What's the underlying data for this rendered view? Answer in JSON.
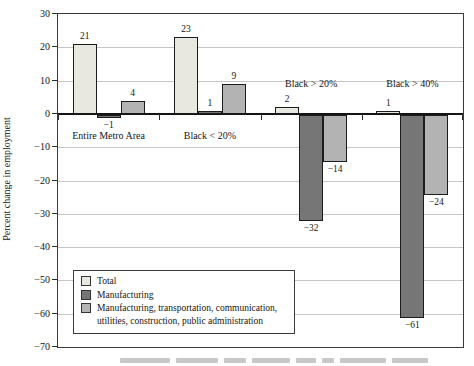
{
  "figure": {
    "y_axis_label": "Percent change in employment"
  },
  "chart_data": {
    "type": "bar",
    "title": "",
    "xlabel": "",
    "ylabel": "Percent change in employment",
    "ylim": [
      -70,
      30
    ],
    "yticks": [
      30,
      20,
      10,
      0,
      -10,
      -20,
      -30,
      -40,
      -50,
      -60,
      -70
    ],
    "grid": true,
    "bar_value_labels": true,
    "legend_position": "inside bottom-left",
    "categories": [
      "Entire Metro Area",
      "Black < 20%",
      "Black > 20%",
      "Black > 40%"
    ],
    "category_label_above_axis": [
      false,
      false,
      true,
      true
    ],
    "series": [
      {
        "name": "Total",
        "color": "#e8e7e0",
        "values": [
          21,
          23,
          2,
          1
        ]
      },
      {
        "name": "Manufacturing",
        "color": "#767676",
        "values": [
          -1,
          1,
          -32,
          -61
        ]
      },
      {
        "name": "Manufacturing, transportation, communication, utilities, construction, public administration",
        "color": "#b3b3b3",
        "values": [
          4,
          9,
          -14,
          -24
        ]
      }
    ]
  }
}
